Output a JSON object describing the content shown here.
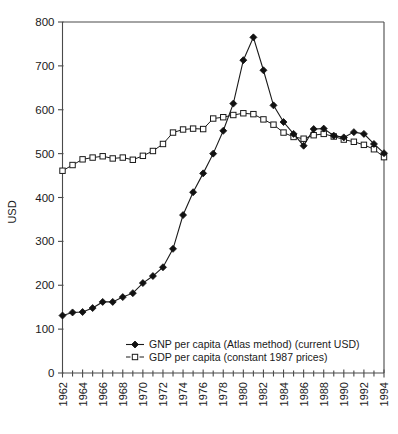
{
  "chart_data": {
    "type": "line",
    "title": "",
    "xlabel": "",
    "ylabel": "USD",
    "ylim": [
      0,
      800
    ],
    "ytick_values": [
      0,
      100,
      200,
      300,
      400,
      500,
      600,
      700,
      800
    ],
    "ytick_labels": [
      "0",
      "100",
      "200",
      "300",
      "400",
      "500",
      "600",
      "700",
      "800"
    ],
    "xlim": [
      1962,
      1994
    ],
    "x": [
      1962,
      1963,
      1964,
      1965,
      1966,
      1967,
      1968,
      1969,
      1970,
      1971,
      1972,
      1973,
      1974,
      1975,
      1976,
      1977,
      1978,
      1979,
      1980,
      1981,
      1982,
      1983,
      1984,
      1985,
      1986,
      1987,
      1988,
      1989,
      1990,
      1991,
      1992,
      1993,
      1994
    ],
    "xtick_labels": [
      "1962",
      "1964",
      "1966",
      "1968",
      "1970",
      "1972",
      "1974",
      "1976",
      "1978",
      "1980",
      "1982",
      "1984",
      "1986",
      "1988",
      "1990",
      "1992",
      "1994"
    ],
    "xtick_label_years": [
      1962,
      1964,
      1966,
      1968,
      1970,
      1972,
      1974,
      1976,
      1978,
      1980,
      1982,
      1984,
      1986,
      1988,
      1990,
      1992,
      1994
    ],
    "xtick_label_rotation": -90,
    "grid": false,
    "legend_position": "inside-bottom-center",
    "series": [
      {
        "name": "GNP per capita (Atlas method) (current USD)",
        "marker": "filled-diamond",
        "line_style": "solid",
        "color": "#111111",
        "values": [
          131,
          138,
          139,
          148,
          162,
          162,
          173,
          182,
          205,
          221,
          241,
          283,
          360,
          412,
          455,
          500,
          552,
          614,
          713,
          765,
          690,
          610,
          572,
          545,
          518,
          556,
          557,
          541,
          537,
          549,
          545,
          522,
          501
        ]
      },
      {
        "name": "GDP per capita (constant 1987 prices)",
        "marker": "open-square",
        "line_style": "solid",
        "color": "#1a1a1a",
        "values": [
          461,
          474,
          487,
          491,
          494,
          489,
          491,
          486,
          495,
          506,
          522,
          548,
          555,
          557,
          556,
          580,
          583,
          588,
          592,
          590,
          578,
          566,
          548,
          538,
          534,
          542,
          545,
          539,
          532,
          527,
          520,
          510,
          492
        ]
      }
    ],
    "legend": [
      {
        "label": "GNP per capita (Atlas method) (current USD)",
        "marker": "filled-diamond"
      },
      {
        "label": "GDP per capita (constant 1987 prices)",
        "marker": "open-square"
      }
    ]
  }
}
